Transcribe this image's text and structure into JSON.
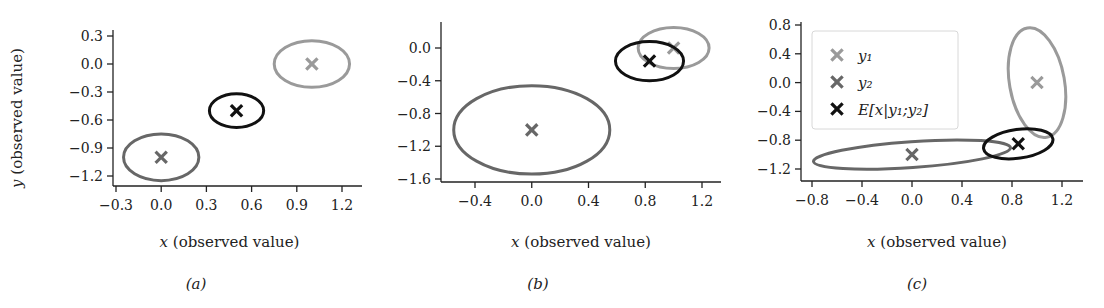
{
  "colors": {
    "y1": "#9a9a9a",
    "y2": "#676767",
    "estimate": "#111111",
    "axis": "#222222",
    "legend_border": "#d8d8d8"
  },
  "chart_data": [
    {
      "type": "scatter",
      "caption": "(a)",
      "title": "",
      "xlabel": "x (observed value)",
      "xlabel_var": "x",
      "xlabel_rest": " (observed value)",
      "ylabel": "y (observed value)",
      "ylabel_var": "y",
      "ylabel_rest": " (observed value)",
      "xlim": [
        -0.32,
        1.32
      ],
      "ylim": [
        -1.3,
        0.33
      ],
      "xticks": [
        "-0.3",
        "0.0",
        "0.3",
        "0.6",
        "0.9",
        "1.2"
      ],
      "yticks": [
        "0.3",
        "0.0",
        "-0.3",
        "-0.6",
        "-0.9",
        "-1.2"
      ],
      "grid": false,
      "legend": null,
      "series": [
        {
          "name": "y1",
          "label": "y₁",
          "color_key": "y1",
          "x": 1.0,
          "y": 0.0,
          "ellipse": {
            "width": 0.5,
            "height": 0.5,
            "angle_deg": 0
          }
        },
        {
          "name": "y2",
          "label": "y₂",
          "color_key": "y2",
          "x": 0.0,
          "y": -1.0,
          "ellipse": {
            "width": 0.5,
            "height": 0.5,
            "angle_deg": 0
          }
        },
        {
          "name": "E[x|y1;y2]",
          "label": "E[x|y₁;y₂]",
          "color_key": "estimate",
          "x": 0.5,
          "y": -0.5,
          "ellipse": {
            "width": 0.36,
            "height": 0.36,
            "angle_deg": 0
          }
        }
      ]
    },
    {
      "type": "scatter",
      "caption": "(b)",
      "title": "",
      "xlabel": "x (observed value)",
      "xlabel_var": "x",
      "xlabel_rest": " (observed value)",
      "ylabel": "",
      "xlim": [
        -0.64,
        1.33
      ],
      "ylim": [
        -1.62,
        0.32
      ],
      "xticks": [
        "-0.4",
        "0.0",
        "0.4",
        "0.8",
        "1.2"
      ],
      "yticks": [
        "0.0",
        "-0.4",
        "-0.8",
        "-1.2",
        "-1.6"
      ],
      "grid": false,
      "legend": null,
      "series": [
        {
          "name": "y1",
          "label": "y₁",
          "color_key": "y1",
          "x": 1.0,
          "y": 0.0,
          "ellipse": {
            "width": 0.5,
            "height": 0.5,
            "angle_deg": 0
          }
        },
        {
          "name": "y2",
          "label": "y₂",
          "color_key": "y2",
          "x": 0.0,
          "y": -1.0,
          "ellipse": {
            "width": 1.1,
            "height": 1.08,
            "angle_deg": 0
          }
        },
        {
          "name": "E[x|y1;y2]",
          "label": "E[x|y₁;y₂]",
          "color_key": "estimate",
          "x": 0.83,
          "y": -0.16,
          "ellipse": {
            "width": 0.48,
            "height": 0.48,
            "angle_deg": 0
          }
        }
      ]
    },
    {
      "type": "scatter",
      "caption": "(c)",
      "title": "",
      "xlabel": "x (observed value)",
      "xlabel_var": "x",
      "xlabel_rest": " (observed value)",
      "ylabel": "",
      "xlim": [
        -0.91,
        1.35
      ],
      "ylim": [
        -1.35,
        0.87
      ],
      "xticks": [
        "-0.8",
        "-0.4",
        "0.0",
        "0.4",
        "0.8",
        "1.2"
      ],
      "yticks": [
        "0.8",
        "0.4",
        "0.0",
        "-0.4",
        "-0.8",
        "-1.2"
      ],
      "grid": false,
      "legend": {
        "position": "upper left",
        "entries": [
          {
            "marker": "x",
            "color_key": "y1",
            "label": "y₁"
          },
          {
            "marker": "x",
            "color_key": "y2",
            "label": "y₂"
          },
          {
            "marker": "x",
            "color_key": "estimate",
            "label": "E[x|y₁;y₂]"
          }
        ]
      },
      "series": [
        {
          "name": "y1",
          "label": "y₁",
          "color_key": "y1",
          "x": 1.0,
          "y": 0.0,
          "ellipse": {
            "width": 0.44,
            "height": 1.54,
            "angle_deg": -10
          }
        },
        {
          "name": "y2",
          "label": "y₂",
          "color_key": "y2",
          "x": 0.0,
          "y": -1.0,
          "ellipse": {
            "width": 1.58,
            "height": 0.36,
            "angle_deg": -4
          }
        },
        {
          "name": "E[x|y1;y2]",
          "label": "E[x|y₁;y₂]",
          "color_key": "estimate",
          "x": 0.85,
          "y": -0.85,
          "ellipse": {
            "width": 0.56,
            "height": 0.4,
            "angle_deg": -8
          }
        }
      ]
    }
  ],
  "layout": {
    "panels": [
      {
        "axis_left": 113,
        "axis_top": 30,
        "axis_right": 362,
        "axis_bottom": 186,
        "x_px": [
          [
            -0.3,
            116
          ],
          [
            1.2,
            342
          ]
        ],
        "y_px": [
          [
            0.3,
            36
          ],
          [
            -1.2,
            176
          ]
        ],
        "xlabel_y": 247,
        "caption_y": 289,
        "caption_x": 196,
        "ylabel_x": 12
      },
      {
        "axis_left": 441,
        "axis_top": 22,
        "axis_right": 721,
        "axis_bottom": 182,
        "x_px": [
          [
            -0.4,
            475
          ],
          [
            1.2,
            702
          ]
        ],
        "y_px": [
          [
            0.0,
            48
          ],
          [
            -1.6,
            179
          ]
        ],
        "xlabel_y": 247,
        "caption_x": 538,
        "caption_y": 289
      },
      {
        "axis_left": 801,
        "axis_top": 22,
        "axis_right": 1083,
        "axis_bottom": 181,
        "x_px": [
          [
            -0.8,
            812
          ],
          [
            1.2,
            1062
          ]
        ],
        "y_px": [
          [
            0.8,
            25
          ],
          [
            -1.2,
            169
          ]
        ],
        "xlabel_y": 247,
        "caption_x": 917,
        "caption_y": 289,
        "legend_box": {
          "x": 812,
          "y": 31,
          "w": 146,
          "h": 98
        }
      }
    ]
  }
}
